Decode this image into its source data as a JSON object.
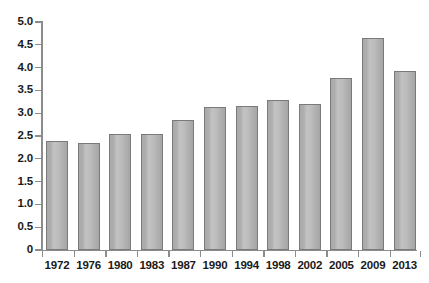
{
  "chart_data": {
    "type": "bar",
    "title": "",
    "subtitle": "",
    "xlabel": "",
    "ylabel": "",
    "categories": [
      "1972",
      "1976",
      "1980",
      "1983",
      "1987",
      "1990",
      "1994",
      "1998",
      "2002",
      "2005",
      "2009",
      "2013"
    ],
    "values": [
      2.38,
      2.34,
      2.54,
      2.54,
      2.84,
      3.13,
      3.16,
      3.3,
      3.21,
      3.77,
      4.66,
      3.93
    ],
    "series": [
      {
        "name": "",
        "values": [
          2.38,
          2.34,
          2.54,
          2.54,
          2.84,
          3.13,
          3.16,
          3.3,
          3.21,
          3.77,
          4.66,
          3.93
        ]
      }
    ],
    "ylim": [
      0,
      5.0
    ],
    "ytick_values": [
      0,
      0.5,
      1.0,
      1.5,
      2.0,
      2.5,
      3.0,
      3.5,
      4.0,
      4.5,
      5.0
    ],
    "ytick_labels": [
      "0",
      "0.5",
      "1.0",
      "1.5",
      "2.0",
      "2.5",
      "3.0",
      "3.5",
      "4.0",
      "4.5",
      "5.0"
    ],
    "xtick_labels": [
      "1972",
      "1976",
      "1980",
      "1983",
      "1987",
      "1990",
      "1994",
      "1998",
      "2002",
      "2005",
      "2009",
      "2013"
    ],
    "grid": false,
    "legend": false,
    "legend_position": "none",
    "annotations": [],
    "bar_fill_color": "#b5b5b5",
    "bar_border_color": "#7a7a7a",
    "axis_color": "#8c8c8c",
    "text_color": "#1a1a1a",
    "background_color": "#ffffff"
  }
}
